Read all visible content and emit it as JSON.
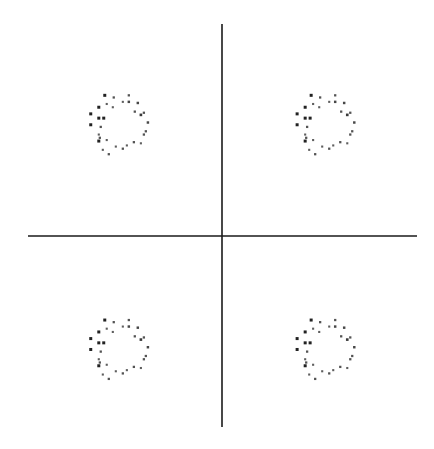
{
  "chart_data": {
    "type": "scatter",
    "title": "",
    "xlabel": "",
    "ylabel": "",
    "xlim": [
      -1.88,
      1.88
    ],
    "ylim": [
      -1.7,
      1.7
    ],
    "grid": false,
    "legend": "none",
    "colors": {
      "axes": "#1a1a1a",
      "points": "#222222"
    },
    "constellation_points": [
      {
        "name": "upper-left",
        "x": -1.0,
        "y": 1.0
      },
      {
        "name": "upper-right",
        "x": 1.0,
        "y": 1.0
      },
      {
        "name": "lower-left",
        "x": -1.0,
        "y": -1.0
      },
      {
        "name": "lower-right",
        "x": 1.0,
        "y": -1.0
      }
    ],
    "noise_offsets": [
      {
        "dx": -0.136,
        "dy": 0.252,
        "w": 1.0
      },
      {
        "dx": -0.049,
        "dy": 0.233,
        "w": 0.6
      },
      {
        "dx": 0.097,
        "dy": 0.252,
        "w": 0.6
      },
      {
        "dx": 0.097,
        "dy": 0.194,
        "w": 0.7
      },
      {
        "dx": 0.039,
        "dy": 0.194,
        "w": 0.5
      },
      {
        "dx": 0.184,
        "dy": 0.184,
        "w": 0.7
      },
      {
        "dx": -0.194,
        "dy": 0.146,
        "w": 1.0
      },
      {
        "dx": -0.117,
        "dy": 0.175,
        "w": 0.5
      },
      {
        "dx": -0.058,
        "dy": 0.146,
        "w": 0.5
      },
      {
        "dx": 0.155,
        "dy": 0.107,
        "w": 0.6
      },
      {
        "dx": 0.243,
        "dy": 0.097,
        "w": 0.6
      },
      {
        "dx": 0.214,
        "dy": 0.078,
        "w": 0.8
      },
      {
        "dx": -0.272,
        "dy": 0.087,
        "w": 1.0
      },
      {
        "dx": -0.194,
        "dy": 0.049,
        "w": 1.0
      },
      {
        "dx": -0.146,
        "dy": 0.049,
        "w": 1.0
      },
      {
        "dx": 0.282,
        "dy": 0.01,
        "w": 0.7
      },
      {
        "dx": -0.272,
        "dy": -0.01,
        "w": 1.0
      },
      {
        "dx": -0.175,
        "dy": -0.029,
        "w": 0.6
      },
      {
        "dx": 0.262,
        "dy": -0.068,
        "w": 0.6
      },
      {
        "dx": 0.243,
        "dy": -0.097,
        "w": 0.6
      },
      {
        "dx": -0.194,
        "dy": -0.097,
        "w": 0.5
      },
      {
        "dx": -0.184,
        "dy": -0.126,
        "w": 0.6
      },
      {
        "dx": -0.194,
        "dy": -0.155,
        "w": 1.0
      },
      {
        "dx": -0.117,
        "dy": -0.146,
        "w": 0.5
      },
      {
        "dx": 0.146,
        "dy": -0.165,
        "w": 0.6
      },
      {
        "dx": 0.214,
        "dy": -0.175,
        "w": 0.5
      },
      {
        "dx": -0.029,
        "dy": -0.204,
        "w": 0.5
      },
      {
        "dx": 0.039,
        "dy": -0.223,
        "w": 0.6
      },
      {
        "dx": 0.078,
        "dy": -0.194,
        "w": 0.5
      },
      {
        "dx": -0.155,
        "dy": -0.233,
        "w": 0.5
      },
      {
        "dx": -0.097,
        "dy": -0.272,
        "w": 0.6
      }
    ]
  }
}
